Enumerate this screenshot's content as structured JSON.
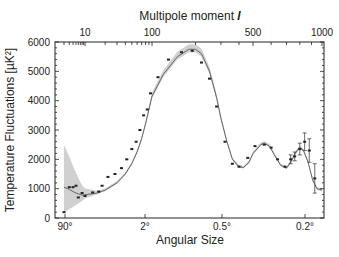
{
  "chart_data": {
    "type": "line",
    "title": "",
    "top_axis_title": "Multipole moment",
    "top_axis_symbol": "l",
    "xlabel": "Angular Size",
    "ylabel": "Temperature Fluctuations [µK²]",
    "ylim": [
      0,
      6000
    ],
    "y_ticks": [
      0,
      1000,
      2000,
      3000,
      4000,
      5000,
      6000
    ],
    "top_ticks": [
      {
        "label": "10",
        "l": 10
      },
      {
        "label": "100",
        "l": 100
      },
      {
        "label": "500",
        "l": 500
      },
      {
        "label": "1000",
        "l": 1000
      }
    ],
    "bottom_ticks": [
      {
        "label": "90°",
        "l": 2
      },
      {
        "label": "2°",
        "l": 90
      },
      {
        "label": "0.5°",
        "l": 400
      },
      {
        "label": "0.2°",
        "l": 900
      }
    ],
    "grid": false,
    "series": [
      {
        "name": "Model fit",
        "style": "line",
        "color": "#666666",
        "points": [
          [
            2,
            1050
          ],
          [
            3,
            980
          ],
          [
            4,
            900
          ],
          [
            6,
            820
          ],
          [
            8,
            780
          ],
          [
            10,
            790
          ],
          [
            15,
            850
          ],
          [
            20,
            950
          ],
          [
            30,
            1200
          ],
          [
            40,
            1500
          ],
          [
            50,
            1850
          ],
          [
            60,
            2250
          ],
          [
            70,
            2700
          ],
          [
            80,
            3200
          ],
          [
            100,
            4150
          ],
          [
            120,
            4900
          ],
          [
            150,
            5500
          ],
          [
            180,
            5750
          ],
          [
            200,
            5750
          ],
          [
            220,
            5600
          ],
          [
            250,
            5000
          ],
          [
            280,
            4100
          ],
          [
            300,
            3400
          ],
          [
            330,
            2600
          ],
          [
            360,
            2000
          ],
          [
            400,
            1750
          ],
          [
            430,
            1720
          ],
          [
            470,
            1900
          ],
          [
            500,
            2200
          ],
          [
            540,
            2500
          ],
          [
            560,
            2550
          ],
          [
            590,
            2450
          ],
          [
            620,
            2150
          ],
          [
            660,
            1800
          ],
          [
            700,
            1700
          ],
          [
            730,
            1900
          ],
          [
            770,
            2250
          ],
          [
            800,
            2400
          ],
          [
            830,
            2300
          ],
          [
            870,
            1900
          ],
          [
            910,
            1300
          ],
          [
            950,
            1000
          ],
          [
            1000,
            950
          ]
        ]
      },
      {
        "name": "Measurements",
        "style": "points",
        "color": "#222222",
        "points": [
          [
            2,
            200,
            0
          ],
          [
            3,
            1050,
            0
          ],
          [
            4,
            1050,
            0
          ],
          [
            5,
            1100,
            0
          ],
          [
            6,
            700,
            0
          ],
          [
            8,
            850,
            0
          ],
          [
            10,
            750,
            0
          ],
          [
            13,
            870,
            0
          ],
          [
            16,
            900,
            0
          ],
          [
            18,
            1100,
            0
          ],
          [
            22,
            1400,
            0
          ],
          [
            28,
            1500,
            0
          ],
          [
            35,
            1700,
            0
          ],
          [
            42,
            2000,
            0
          ],
          [
            50,
            2350,
            0
          ],
          [
            58,
            2600,
            0
          ],
          [
            66,
            3000,
            0
          ],
          [
            75,
            3500,
            0
          ],
          [
            85,
            3700,
            0
          ],
          [
            95,
            4250,
            0
          ],
          [
            110,
            4800,
            0
          ],
          [
            130,
            5400,
            0
          ],
          [
            160,
            5650,
            0
          ],
          [
            190,
            5700,
            0
          ],
          [
            220,
            5300,
            0
          ],
          [
            250,
            4750,
            0
          ],
          [
            280,
            3800,
            0
          ],
          [
            320,
            2600,
            0
          ],
          [
            360,
            1850,
            0
          ],
          [
            400,
            1750,
            0
          ],
          [
            460,
            2050,
            0
          ],
          [
            510,
            2450,
            0
          ],
          [
            560,
            2500,
            0
          ],
          [
            600,
            2400,
            0
          ],
          [
            640,
            2000,
            0
          ],
          [
            690,
            1750,
            0
          ],
          [
            730,
            2000,
            150
          ],
          [
            760,
            2100,
            150
          ],
          [
            800,
            2350,
            200
          ],
          [
            840,
            2600,
            300
          ],
          [
            880,
            2300,
            400
          ],
          [
            930,
            1350,
            500
          ]
        ]
      }
    ],
    "band": {
      "name": "Cosmic variance",
      "color": "#c8c8c8"
    }
  }
}
